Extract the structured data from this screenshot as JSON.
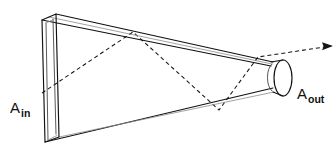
{
  "figure": {
    "background_color": "#ffffff",
    "line_color": "#111111",
    "ray_color": "#141414",
    "width": 336,
    "height": 156
  },
  "labels": {
    "input_aperture": {
      "base": "A",
      "subscript": "in"
    },
    "output_aperture": {
      "base": "A",
      "subscript": "out"
    }
  },
  "geometry": {
    "input_face": {
      "name": "rectangular-input-aperture",
      "front_outline": "45,142 42,20 56,14 59,137",
      "inner_outline": "48,139 46,23 54,19 56,134",
      "top_back_edge": "42,20 56,14",
      "bottom_back_edge": "45,142 59,137"
    },
    "taper_top_front": "42,20 270,66",
    "taper_top_back": "56,14 272,62",
    "taper_bottom_front": "45,142 272,88",
    "taper_bottom_back": "59,137 274,92",
    "output_cylinder": {
      "name": "circular-output-aperture",
      "ellipse_cx": 282,
      "ellipse_cy": 78,
      "ellipse_rx": 9,
      "ellipse_ry": 18,
      "top_edge": "271,62 282,60",
      "bottom_edge": "273,92 282,96"
    },
    "ray_path": "42,93 133,32 219,110 258,57 331,46",
    "arrow_tip": "331,46"
  },
  "annotations": {
    "ray_description": "Incident ray entering input aperture, reflecting off taper walls, exiting output aperture",
    "bounce_points": [
      {
        "x": 133,
        "y": 32,
        "surface": "top-wall"
      },
      {
        "x": 219,
        "y": 110,
        "surface": "bottom-wall"
      },
      {
        "x": 258,
        "y": 57,
        "surface": "top-wall"
      }
    ]
  }
}
